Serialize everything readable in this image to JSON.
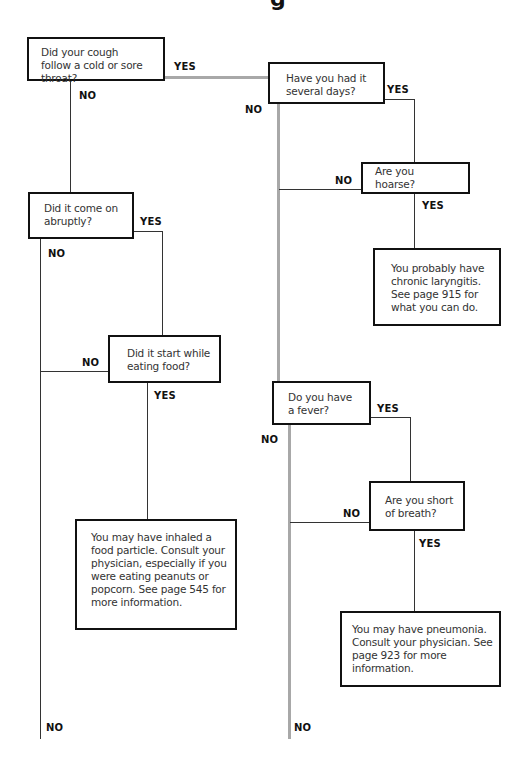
{
  "title_fragment": "g",
  "nodes": {
    "q_cold": "Did your cough follow a cold or sore throat?",
    "q_several_days": "Have you had it several days?",
    "q_hoarse": "Are you hoarse?",
    "r_laryngitis": "You probably have chronic laryngitis. See page 915 for what you can do.",
    "q_abrupt": "Did it come on abruptly?",
    "q_eating": "Did it start while eating food?",
    "r_food_particle": "You may have inhaled a food particle. Consult your physician, especially if you were eating peanuts or popcorn. See page 545 for more information.",
    "q_fever": "Do you have a fever?",
    "q_short_breath": "Are you short of breath?",
    "r_pneumonia": "You may have pneumonia. Consult your physician. See page 923 for more information."
  },
  "labels": {
    "yes": "YES",
    "no": "NO"
  },
  "colors": {
    "box_border": "#111111",
    "thin_line": "#333333",
    "main_path_line": "#a8a8a8"
  }
}
